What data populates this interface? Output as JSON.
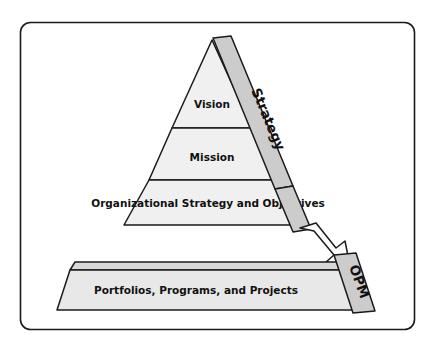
{
  "figure": {
    "name": "organizational-strategy-pyramid",
    "frame": {
      "visible": true,
      "border_color": "#1a1a1a"
    },
    "colors": {
      "pyramid_fill": "#f0f0f0",
      "band_fill": "#cccccc",
      "banner_fill": "#e8e8e8",
      "banner_top_fill": "#d8d8d8",
      "arrow_fill": "#ffffff",
      "outline": "#1a1a1a",
      "text": "#111111",
      "background": "#ffffff"
    },
    "pyramid": {
      "name": "strategy-pyramid",
      "tiers": [
        {
          "id": "vision",
          "label": "Vision"
        },
        {
          "id": "mission",
          "label": "Mission"
        },
        {
          "id": "org-strategy",
          "label": "Organizational Strategy and Objectives"
        }
      ]
    },
    "bands": [
      {
        "id": "strategy",
        "label": "Strategy",
        "orientation": "diagonal-right-descending"
      },
      {
        "id": "opm",
        "label": "OPM",
        "orientation": "vertical-rotated"
      }
    ],
    "banner": {
      "id": "portfolios-programs-projects",
      "label": "Portfolios, Programs, and Projects"
    },
    "arrow": {
      "id": "strategy-to-opm-arrow",
      "label": "",
      "direction": "down-right",
      "from": "Strategy",
      "to": "OPM"
    }
  }
}
